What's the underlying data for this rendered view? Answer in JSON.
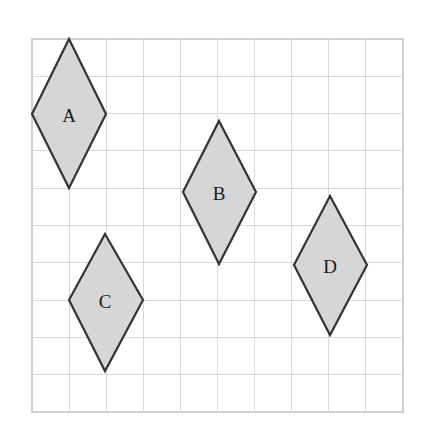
{
  "figure": {
    "background_color": "#ffffff"
  },
  "grid": {
    "x": 32,
    "y": 39,
    "width": 371,
    "height": 373,
    "columns": 10,
    "rows": 10,
    "cell_width": 37.1,
    "cell_height": 37.3,
    "line_color": "#d9d9d9",
    "border_color": "#cfcfcf",
    "fill_color": "#ffffff"
  },
  "style": {
    "shape_fill": "#d6d6d6",
    "shape_stroke": "#333333",
    "label_color": "#1a1a1a"
  },
  "shapes": [
    {
      "label": "A",
      "name": "rhombus-a",
      "points": "69,39 106,114 69,188 32,114",
      "label_x": 69,
      "label_y": 115,
      "center_x": 69,
      "center_y": 114,
      "diagonal_horizontal_cells": 2,
      "diagonal_vertical_cells": 4
    },
    {
      "label": "B",
      "name": "rhombus-b",
      "points": "219,121 256,192 219,264 183,192",
      "label_x": 219,
      "label_y": 193,
      "center_x": 219,
      "center_y": 192,
      "diagonal_horizontal_cells": 2,
      "diagonal_vertical_cells": 4
    },
    {
      "label": "C",
      "name": "rhombus-c",
      "points": "105,234 143,300 105,371 69,300",
      "label_x": 105,
      "label_y": 301,
      "center_x": 105,
      "center_y": 300,
      "diagonal_horizontal_cells": 2,
      "diagonal_vertical_cells": 4
    },
    {
      "label": "D",
      "name": "rhombus-d",
      "points": "330,196 367,265 330,335 294,265",
      "label_x": 330,
      "label_y": 266,
      "center_x": 330,
      "center_y": 265,
      "diagonal_horizontal_cells": 2,
      "diagonal_vertical_cells": 4
    }
  ]
}
